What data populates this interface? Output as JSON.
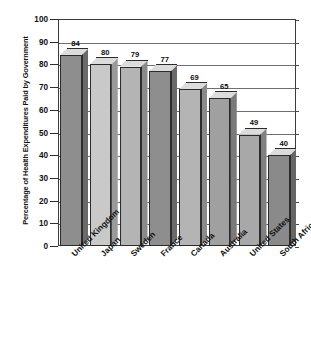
{
  "chart_data": {
    "type": "bar",
    "title": "",
    "subtitle": "",
    "xlabel": "",
    "ylabel": "Percentage of Health Expenditures Paid by Government",
    "ylim": [
      0,
      100
    ],
    "ytick_step": 10,
    "yticks": [
      0,
      10,
      20,
      30,
      40,
      50,
      60,
      70,
      80,
      90,
      100
    ],
    "ytick_labels": [
      "0",
      "10",
      "20",
      "30",
      "40",
      "50",
      "60",
      "70",
      "80",
      "90",
      "100"
    ],
    "grid": true,
    "grid_axis": "y",
    "legend": false,
    "legend_position": "none",
    "style": "3d-bar",
    "categories": [
      "United Kingdom",
      "Japan",
      "Sweden",
      "France",
      "Canada",
      "Australia",
      "United States",
      "South Africa"
    ],
    "values": [
      84,
      80,
      79,
      77,
      69,
      65,
      49,
      40
    ],
    "value_labels": [
      "84",
      "80",
      "79",
      "77",
      "69",
      "65",
      "49",
      "40"
    ],
    "bar_colors": [
      "#8e8e8e",
      "#c9c9c9",
      "#b4b4b4",
      "#8e8e8e",
      "#b4b4b4",
      "#a0a0a0",
      "#a8a8a8",
      "#8a8a8a"
    ],
    "bar_side_colors": [
      "#6a6a6a",
      "#9a9a9a",
      "#8a8a8a",
      "#6a6a6a",
      "#8a8a8a",
      "#7a7a7a",
      "#808080",
      "#666666"
    ],
    "bar_top_color": "#dcdcdc",
    "axis_color": "#3b3b3b",
    "gridline_color": "#6f6f6f",
    "background_color": "#ffffff"
  }
}
